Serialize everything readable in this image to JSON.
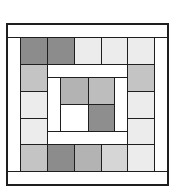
{
  "diagram": {
    "type": "quilt-block",
    "colors": {
      "dark": "#8c8c8c",
      "medium": "#b3b3b3",
      "medium_light": "#c4c4c4",
      "light": "#d6d6d6",
      "very_light": "#ececec",
      "white": "#ffffff",
      "outline": "#1e1e1e"
    },
    "border_strips": [
      {
        "name": "top-strip",
        "x": 7,
        "y": 24,
        "w": 161,
        "h": 14,
        "color": "#ffffff"
      },
      {
        "name": "bottom-strip",
        "x": 7,
        "y": 171,
        "w": 161,
        "h": 14,
        "color": "#ffffff"
      },
      {
        "name": "left-strip",
        "x": 7,
        "y": 37,
        "w": 14,
        "h": 135,
        "color": "#ffffff"
      },
      {
        "name": "right-strip",
        "x": 154,
        "y": 37,
        "w": 14,
        "h": 135,
        "color": "#ffffff"
      }
    ],
    "outer_squares": [
      {
        "row": 0,
        "col": 0,
        "x": 20,
        "y": 37,
        "w": 28,
        "h": 28,
        "color": "#8c8c8c"
      },
      {
        "row": 0,
        "col": 1,
        "x": 47,
        "y": 37,
        "w": 28,
        "h": 28,
        "color": "#8c8c8c"
      },
      {
        "row": 0,
        "col": 2,
        "x": 74,
        "y": 37,
        "w": 28,
        "h": 28,
        "color": "#ececec"
      },
      {
        "row": 0,
        "col": 3,
        "x": 101,
        "y": 37,
        "w": 27,
        "h": 28,
        "color": "#ececec"
      },
      {
        "row": 0,
        "col": 4,
        "x": 127,
        "y": 37,
        "w": 28,
        "h": 28,
        "color": "#ececec"
      },
      {
        "row": 1,
        "col": 0,
        "x": 20,
        "y": 64,
        "w": 28,
        "h": 28,
        "color": "#c4c4c4"
      },
      {
        "row": 1,
        "col": 4,
        "x": 127,
        "y": 64,
        "w": 28,
        "h": 28,
        "color": "#c4c4c4"
      },
      {
        "row": 2,
        "col": 0,
        "x": 20,
        "y": 91,
        "w": 28,
        "h": 28,
        "color": "#ececec"
      },
      {
        "row": 2,
        "col": 4,
        "x": 127,
        "y": 91,
        "w": 28,
        "h": 28,
        "color": "#ececec"
      },
      {
        "row": 3,
        "col": 0,
        "x": 20,
        "y": 118,
        "w": 28,
        "h": 27,
        "color": "#ececec"
      },
      {
        "row": 3,
        "col": 4,
        "x": 127,
        "y": 118,
        "w": 28,
        "h": 27,
        "color": "#ececec"
      },
      {
        "row": 4,
        "col": 0,
        "x": 20,
        "y": 144,
        "w": 28,
        "h": 28,
        "color": "#c4c4c4"
      },
      {
        "row": 4,
        "col": 1,
        "x": 47,
        "y": 144,
        "w": 28,
        "h": 28,
        "color": "#8c8c8c"
      },
      {
        "row": 4,
        "col": 2,
        "x": 74,
        "y": 144,
        "w": 28,
        "h": 28,
        "color": "#b3b3b3"
      },
      {
        "row": 4,
        "col": 3,
        "x": 101,
        "y": 144,
        "w": 27,
        "h": 28,
        "color": "#d6d6d6"
      },
      {
        "row": 4,
        "col": 4,
        "x": 127,
        "y": 144,
        "w": 28,
        "h": 28,
        "color": "#ececec"
      }
    ],
    "inner_ring": [
      {
        "name": "inner-top-bar",
        "x": 47,
        "y": 64,
        "w": 81,
        "h": 14,
        "color": "#ffffff"
      },
      {
        "name": "inner-bottom-bar",
        "x": 47,
        "y": 131,
        "w": 81,
        "h": 14,
        "color": "#ffffff"
      },
      {
        "name": "inner-left-bar",
        "x": 47,
        "y": 77,
        "w": 14,
        "h": 55,
        "color": "#ffffff"
      },
      {
        "name": "inner-right-bar",
        "x": 114,
        "y": 77,
        "w": 14,
        "h": 55,
        "color": "#ffffff"
      }
    ],
    "center_squares": [
      {
        "pos": "top-left",
        "x": 60,
        "y": 77,
        "w": 29,
        "h": 28,
        "color": "#b3b3b3"
      },
      {
        "pos": "top-right",
        "x": 88,
        "y": 77,
        "w": 27,
        "h": 28,
        "color": "#bdbdbd"
      },
      {
        "pos": "bottom-left",
        "x": 60,
        "y": 104,
        "w": 29,
        "h": 28,
        "color": "#ffffff"
      },
      {
        "pos": "bottom-right",
        "x": 88,
        "y": 104,
        "w": 27,
        "h": 28,
        "color": "#8e8e8e"
      }
    ]
  }
}
